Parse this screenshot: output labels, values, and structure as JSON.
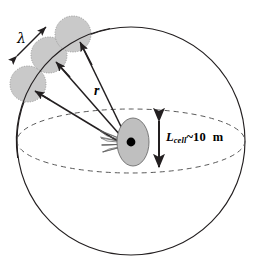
{
  "figure": {
    "type": "diagram",
    "labels": {
      "wavelength": "λ",
      "radius": "r",
      "cell_size_symbol": "L",
      "cell_size_subscript": "cell",
      "cell_size_approx": "~",
      "cell_size_value": "10",
      "cell_size_unit": "m"
    },
    "colors": {
      "stroke": "#231f20",
      "patch_fill": "#c9c9c9",
      "patch_edge": "#8a8a8a",
      "cell_fill": "#bfbfbf",
      "cell_edge": "#6e6e6e",
      "center_dot": "#000000",
      "dashed_equator": "#5a5a5a",
      "background": "#ffffff"
    },
    "geometry": {
      "sphere": {
        "cx": 131,
        "cy": 141,
        "r": 114
      },
      "equator_ellipse": {
        "cx": 131,
        "cy": 141,
        "rx": 114,
        "ry": 32
      },
      "cell_ellipse": {
        "cx": 133,
        "cy": 142,
        "rx": 16,
        "ry": 24
      },
      "center_dot": {
        "cx": 131,
        "cy": 142,
        "r": 4.4
      },
      "patches": [
        {
          "cx": 73,
          "cy": 34,
          "r": 18,
          "name": "patch-upper"
        },
        {
          "cx": 49,
          "cy": 55,
          "r": 18,
          "name": "patch-middle"
        },
        {
          "cx": 28,
          "cy": 84,
          "r": 18,
          "name": "patch-lower"
        }
      ],
      "rays": [
        {
          "name": "ray-to-upper-patch",
          "x1": 128,
          "y1": 141,
          "x2": 78,
          "y2": 40
        },
        {
          "name": "ray-to-middle-patch",
          "x1": 127,
          "y1": 143,
          "x2": 53,
          "y2": 60
        },
        {
          "name": "ray-to-lower-patch",
          "x1": 126,
          "y1": 145,
          "x2": 32,
          "y2": 89
        }
      ],
      "lambda_arrow": {
        "x1": 16,
        "y1": 55,
        "x2": 47,
        "y2": 28
      },
      "cell_size_arrow": {
        "x": 159,
        "y1": 120,
        "y2": 168
      }
    }
  }
}
